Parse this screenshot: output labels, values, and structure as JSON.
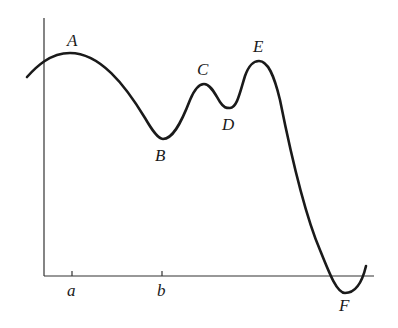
{
  "diagram": {
    "type": "function-graph",
    "colors": {
      "curve": "#1a1a1a",
      "axis": "#333333",
      "background": "#ffffff"
    },
    "axes": {
      "x_ticks": [
        {
          "label": "a",
          "x": 72
        },
        {
          "label": "b",
          "x": 162
        }
      ]
    },
    "points": [
      {
        "label": "A",
        "kind": "local-max",
        "x": 70,
        "y": 53
      },
      {
        "label": "B",
        "kind": "local-min",
        "x": 163,
        "y": 139
      },
      {
        "label": "C",
        "kind": "local-max",
        "x": 204,
        "y": 84
      },
      {
        "label": "D",
        "kind": "local-min",
        "x": 228,
        "y": 108
      },
      {
        "label": "E",
        "kind": "local-max",
        "x": 259,
        "y": 61
      },
      {
        "label": "F",
        "kind": "global-min",
        "x": 345,
        "y": 293
      }
    ]
  }
}
